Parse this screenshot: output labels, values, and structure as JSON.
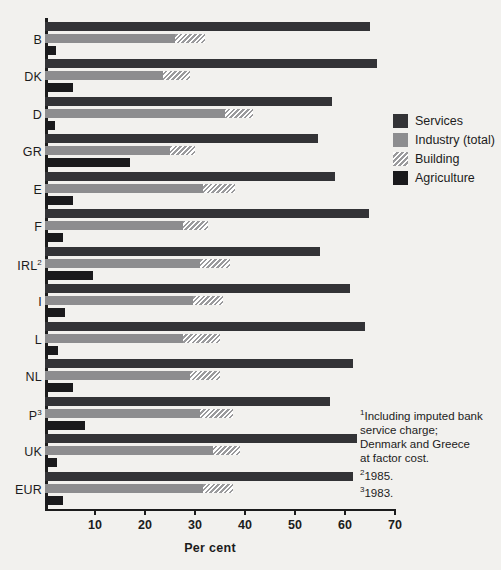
{
  "chart_data": {
    "type": "bar",
    "orientation": "horizontal",
    "title": "",
    "xlabel": "Per cent",
    "ylabel": "",
    "xlim": [
      0,
      70
    ],
    "xticks": [
      10,
      20,
      30,
      40,
      50,
      60,
      70
    ],
    "grid": false,
    "legend_position": "right",
    "categories": [
      "B",
      "DK",
      "D",
      "GR",
      "E",
      "F",
      "IRL",
      "I",
      "L",
      "NL",
      "P",
      "UK",
      "EUR"
    ],
    "category_labels": [
      "B",
      "DK",
      "D",
      "GR",
      "E",
      "F",
      "IRL²",
      "I",
      "L",
      "NL",
      "P³",
      "UK",
      "EUR"
    ],
    "category_footnote_marks": [
      "",
      "",
      "",
      "",
      "",
      "",
      "2",
      "",
      "",
      "",
      "3",
      "",
      ""
    ],
    "series": [
      {
        "name": "Services",
        "color": "#333336",
        "values": [
          65.0,
          66.3,
          57.3,
          54.5,
          58.0,
          64.8,
          55.0,
          61.0,
          64.0,
          61.5,
          57.0,
          62.3,
          61.5
        ]
      },
      {
        "name": "Industry (total)",
        "color": "#8d8d8f",
        "values": [
          32.0,
          29.0,
          41.5,
          30.0,
          38.0,
          32.5,
          37.0,
          35.5,
          35.0,
          35.0,
          37.5,
          39.0,
          37.5
        ]
      },
      {
        "name": "Building",
        "color": "hatched",
        "note": "sub-segment shown hatched at the right-hand end of the Industry (total) bar",
        "values": [
          6.0,
          5.5,
          5.5,
          5.0,
          6.5,
          5.0,
          6.0,
          6.0,
          7.5,
          6.0,
          6.5,
          5.5,
          6.0
        ]
      },
      {
        "name": "Agriculture",
        "color": "#1a1a1c",
        "values": [
          2.2,
          5.6,
          2.0,
          17.0,
          5.6,
          3.6,
          9.6,
          4.0,
          2.6,
          5.6,
          8.0,
          2.3,
          3.6
        ]
      }
    ]
  },
  "legend": {
    "items": [
      {
        "label": "Services",
        "swatch": "services"
      },
      {
        "label": "Industry (total)",
        "swatch": "industry"
      },
      {
        "label": "Building",
        "swatch": "building"
      },
      {
        "label": "Agriculture",
        "swatch": "agriculture"
      }
    ]
  },
  "axis": {
    "x_title": "Per cent",
    "tick_labels": [
      "10",
      "20",
      "30",
      "40",
      "50",
      "60",
      "70"
    ]
  },
  "footnotes": {
    "lines": [
      {
        "mark": "1",
        "text": "Including imputed bank"
      },
      {
        "mark": "",
        "text": "service charge;"
      },
      {
        "mark": "",
        "text": "Denmark and Greece"
      },
      {
        "mark": "",
        "text": "at  factor cost."
      },
      {
        "mark": "2",
        "text": "1985."
      },
      {
        "mark": "3",
        "text": "1983."
      }
    ]
  },
  "colors": {
    "services": "#333336",
    "industry": "#8d8d8f",
    "agriculture": "#1a1a1c",
    "background": "#f2f1ee",
    "axis": "#1c1c1c"
  }
}
